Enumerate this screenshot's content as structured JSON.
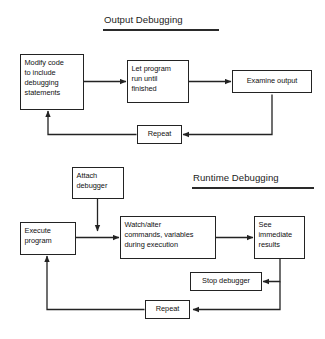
{
  "diagram": {
    "kind": "flowchart",
    "sections": [
      {
        "id": "output-debugging",
        "title": "Output Debugging",
        "nodes": [
          {
            "id": "modify-code",
            "label": "Modify code to include debugging statements"
          },
          {
            "id": "let-program-run",
            "label": "Let program run until finished"
          },
          {
            "id": "examine-output",
            "label": "Examine output"
          },
          {
            "id": "repeat-output",
            "label": "Repeat"
          }
        ],
        "edges": [
          {
            "from": "modify-code",
            "to": "let-program-run"
          },
          {
            "from": "let-program-run",
            "to": "examine-output"
          },
          {
            "from": "examine-output",
            "to": "repeat-output"
          },
          {
            "from": "repeat-output",
            "to": "modify-code"
          }
        ]
      },
      {
        "id": "runtime-debugging",
        "title": "Runtime Debugging",
        "nodes": [
          {
            "id": "attach-debugger",
            "label": "Attach debugger"
          },
          {
            "id": "execute-program",
            "label": "Execute program"
          },
          {
            "id": "watch-alter",
            "label": "Watch/alter commands, variables during execution"
          },
          {
            "id": "see-results",
            "label": "See immediate results"
          },
          {
            "id": "stop-debugger",
            "label": "Stop debugger"
          },
          {
            "id": "repeat-runtime",
            "label": "Repeat"
          }
        ],
        "edges": [
          {
            "from": "attach-debugger",
            "to": "watch-alter"
          },
          {
            "from": "execute-program",
            "to": "watch-alter"
          },
          {
            "from": "watch-alter",
            "to": "see-results"
          },
          {
            "from": "see-results",
            "to": "stop-debugger"
          },
          {
            "from": "see-results",
            "to": "repeat-runtime"
          },
          {
            "from": "repeat-runtime",
            "to": "execute-program"
          }
        ]
      }
    ]
  },
  "nodes": {
    "output": {
      "modify_code_line1": "Modify code",
      "modify_code_line2": "to include",
      "modify_code_line3": "debugging",
      "modify_code_line4": "statements",
      "let_program_line1": "Let program",
      "let_program_line2": "run until",
      "let_program_line3": "finished",
      "examine_output": "Examine output",
      "repeat": "Repeat"
    },
    "runtime": {
      "attach_line1": "Attach",
      "attach_line2": "debugger",
      "execute_line1": "Execute",
      "execute_line2": "program",
      "watch_line1": "Watch/alter",
      "watch_line2": "commands, variables",
      "watch_line3": "during execution",
      "see_line1": "See",
      "see_line2": "immediate",
      "see_line3": "results",
      "stop_debugger": "Stop debugger",
      "repeat": "Repeat"
    }
  },
  "titles": {
    "output_debugging": "Output Debugging",
    "runtime_debugging": "Runtime Debugging"
  },
  "colors": {
    "background": "#ffffff",
    "stroke": "#232323",
    "text": "#111111"
  }
}
